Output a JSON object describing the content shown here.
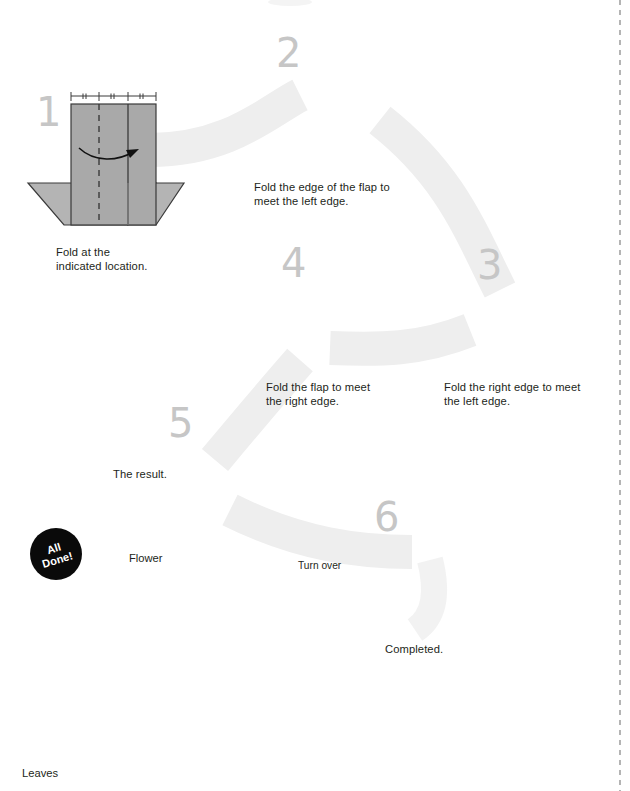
{
  "document": {
    "kind": "origami-instruction-diagram",
    "title": "Origami flower folding steps",
    "page_background": "#ffffff",
    "right_margin_rule": "dashed vertical line at right edge"
  },
  "palette": {
    "paper_front": "#a9a9a9",
    "paper_back": "#bcbcbc",
    "paper_light": "#d9d9d9",
    "paper_dark_center": "#565656",
    "outline": "#3a3a3a",
    "step_number": "#c6c6c6",
    "flow_ribbon": "#eeeeee",
    "text": "#231f20",
    "badge_background": "#0a0a0a",
    "badge_text": "#ffffff"
  },
  "steps": [
    {
      "id": 1,
      "number": "1",
      "caption": "Fold at the\nindicated location.",
      "arrow": "curved valley-fold arrow pointing right",
      "markings": "three equal measurement segments with double tick marks along top edge"
    },
    {
      "id": 2,
      "number": "2",
      "caption": "Fold the edge of the flap to\nmeet the left edge.",
      "arrow": "curved arrow pointing left"
    },
    {
      "id": 3,
      "number": "3",
      "caption": "Fold the right edge to meet\nthe left edge.",
      "arrow": "curved arrow pointing left"
    },
    {
      "id": 4,
      "number": "4",
      "caption": "Fold the flap to meet\nthe right edge.",
      "arrow": "curved arrow pointing right"
    },
    {
      "id": 5,
      "number": "5",
      "caption": "The result.",
      "arrow": "none"
    },
    {
      "id": 6,
      "number": "6",
      "caption": "Completed.",
      "arrow": "none"
    }
  ],
  "turn_over": {
    "label": "Turn over",
    "icon": "turn-over-loop-arrow"
  },
  "final": {
    "badge_line1": "All",
    "badge_line2": "Done!",
    "label_flower": "Flower",
    "label_leaves": "Leaves",
    "petal_count": 4,
    "center": "dark square"
  }
}
